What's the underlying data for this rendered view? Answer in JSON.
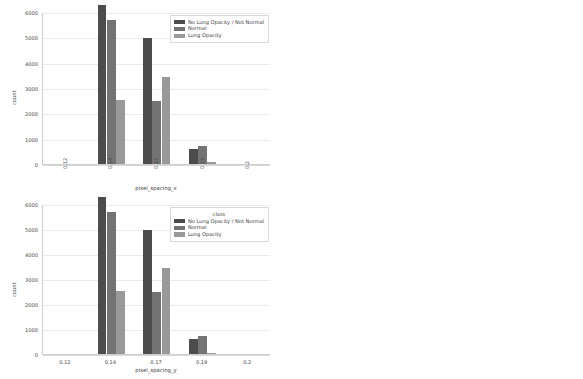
{
  "figure": {
    "background": "#ffffff",
    "panel_count": 4,
    "layout": "2x2 grid of grouped bar charts"
  },
  "palette": {
    "class_series": [
      "#4c4c4c",
      "#737373",
      "#999999"
    ],
    "target_series": [
      "#595959",
      "#8c8c8c"
    ],
    "gridline": "#eaeaea",
    "axis": "#cfcfcf",
    "text": "#4a4a4a"
  },
  "chart_data": [
    {
      "id": "top-left",
      "type": "bar",
      "title": "",
      "xlabel": "pixel_spacing_x",
      "ylabel": "count",
      "categories": [
        "0.12",
        "0.14",
        "0.17",
        "0.19",
        "0.2"
      ],
      "xtick_rotation": -90,
      "ylim": [
        0,
        6000
      ],
      "yticks": [
        0,
        1000,
        2000,
        3000,
        4000,
        5000,
        6000
      ],
      "grid": true,
      "legend_position": "upper right",
      "legend_title": "",
      "series": [
        {
          "name": "No Lung Opacity / Not Normal",
          "color": "#4c4c4c",
          "values": [
            0,
            6290,
            4960,
            600,
            0
          ]
        },
        {
          "name": "Normal",
          "color": "#737373",
          "values": [
            0,
            5700,
            2490,
            720,
            0
          ]
        },
        {
          "name": "Lung Opacity",
          "color": "#999999",
          "values": [
            0,
            2520,
            3430,
            60,
            0
          ]
        }
      ]
    },
    {
      "id": "top-right",
      "type": "bar",
      "title": "",
      "xlabel": "pixel_spacing_x",
      "ylabel": "count",
      "categories": [
        "0.12",
        "0.14",
        "0.17",
        "0.19",
        "0.2"
      ],
      "xtick_rotation": -90,
      "ylim": [
        0,
        12000
      ],
      "yticks": [
        0,
        2000,
        4000,
        6000,
        8000,
        10000,
        12000
      ],
      "grid": true,
      "legend_position": "upper right",
      "legend_title": "",
      "series": [
        {
          "name": "0",
          "color": "#595959",
          "values": [
            0,
            11900,
            7470,
            1340,
            0
          ]
        },
        {
          "name": "1",
          "color": "#8c8c8c",
          "values": [
            0,
            2450,
            3410,
            70,
            0
          ]
        }
      ]
    },
    {
      "id": "bottom-left",
      "type": "bar",
      "title": "",
      "xlabel": "pixel_spacing_y",
      "ylabel": "count",
      "categories": [
        "0.12",
        "0.14",
        "0.17",
        "0.19",
        "0.2"
      ],
      "xtick_rotation": 0,
      "ylim": [
        0,
        6000
      ],
      "yticks": [
        0,
        1000,
        2000,
        3000,
        4000,
        5000,
        6000
      ],
      "grid": true,
      "legend_position": "upper right",
      "legend_title": "class",
      "series": [
        {
          "name": "No Lung Opacity / Not Normal",
          "color": "#4c4c4c",
          "values": [
            0,
            6290,
            4960,
            600,
            0
          ]
        },
        {
          "name": "Normal",
          "color": "#737373",
          "values": [
            0,
            5700,
            2490,
            720,
            0
          ]
        },
        {
          "name": "Lung Opacity",
          "color": "#999999",
          "values": [
            0,
            2520,
            3430,
            60,
            0
          ]
        }
      ]
    },
    {
      "id": "bottom-right",
      "type": "bar",
      "title": "",
      "xlabel": "pixel_spacing_y",
      "ylabel": "count",
      "categories": [
        "0.12",
        "0.14",
        "0.17",
        "0.19",
        "0.2"
      ],
      "xtick_rotation": 0,
      "ylim": [
        0,
        12000
      ],
      "yticks": [
        0,
        2000,
        4000,
        6000,
        8000,
        10000,
        12000
      ],
      "grid": true,
      "legend_position": "upper right",
      "legend_title": "Target",
      "series": [
        {
          "name": "0",
          "color": "#595959",
          "values": [
            0,
            11900,
            7470,
            1340,
            0
          ]
        },
        {
          "name": "1",
          "color": "#8c8c8c",
          "values": [
            0,
            2450,
            3410,
            70,
            0
          ]
        }
      ]
    }
  ]
}
